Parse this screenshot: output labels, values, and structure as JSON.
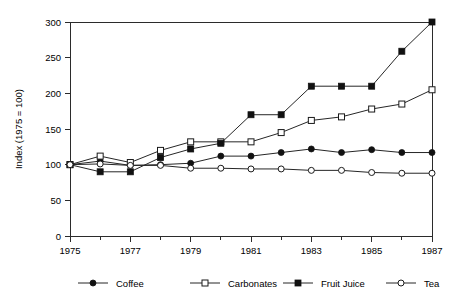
{
  "chart_data": {
    "type": "line",
    "title": "",
    "xlabel": "",
    "ylabel": "Index (1975 = 100)",
    "x": [
      1975,
      1976,
      1977,
      1978,
      1979,
      1980,
      1981,
      1982,
      1983,
      1984,
      1985,
      1986,
      1987
    ],
    "xlim": [
      1975,
      1987
    ],
    "ylim": [
      0,
      300
    ],
    "yticks": [
      0,
      50,
      100,
      150,
      200,
      250,
      300
    ],
    "ytick_labels": [
      "0",
      "50",
      "100",
      "150",
      "200",
      "250",
      "300"
    ],
    "xticks_major": [
      1975,
      1977,
      1979,
      1981,
      1983,
      1985,
      1987
    ],
    "xtick_labels": [
      "1975",
      "1977",
      "1979",
      "1981",
      "1983",
      "1985",
      "1987"
    ],
    "xticks_minor": [
      1976,
      1978,
      1980,
      1982,
      1984,
      1986
    ],
    "grid": false,
    "legend_position": "bottom",
    "series": [
      {
        "name": "Coffee",
        "marker": "filled-circle",
        "values": [
          100,
          105,
          99,
          100,
          102,
          112,
          112,
          117,
          122,
          117,
          121,
          117,
          117
        ]
      },
      {
        "name": "Carbonates",
        "marker": "open-square",
        "values": [
          100,
          112,
          103,
          120,
          132,
          132,
          132,
          145,
          162,
          167,
          178,
          185,
          205
        ]
      },
      {
        "name": "Fruit Juice",
        "marker": "filled-square",
        "values": [
          100,
          90,
          90,
          110,
          122,
          130,
          170,
          170,
          210,
          210,
          210,
          259,
          300
        ]
      },
      {
        "name": "Tea",
        "marker": "open-circle",
        "values": [
          100,
          101,
          99,
          99,
          95,
          95,
          94,
          94,
          92,
          92,
          89,
          88,
          88
        ]
      }
    ]
  },
  "legend": {
    "items": [
      {
        "label": "Coffee",
        "marker": "filled-circle"
      },
      {
        "label": "Carbonates",
        "marker": "open-square"
      },
      {
        "label": "Fruit Juice",
        "marker": "filled-square"
      },
      {
        "label": "Tea",
        "marker": "open-circle"
      }
    ]
  },
  "colors": {
    "line": "#262626",
    "marker_fill": "#111111",
    "marker_open_fill": "#ffffff",
    "axis": "#2b2b2b",
    "text": "#000000",
    "background": "#ffffff"
  }
}
